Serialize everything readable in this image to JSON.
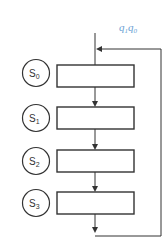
{
  "diagram": {
    "title_label": {
      "main1": "q",
      "sub1": "1",
      "main2": "q",
      "sub2": "0",
      "color": "#6a9fd4"
    },
    "states": [
      {
        "letter": "S",
        "index": "0"
      },
      {
        "letter": "S",
        "index": "1"
      },
      {
        "letter": "S",
        "index": "2"
      },
      {
        "letter": "S",
        "index": "3"
      }
    ],
    "stages": [
      {
        "label": ""
      },
      {
        "label": ""
      },
      {
        "label": ""
      },
      {
        "label": ""
      }
    ],
    "line_color": "#333333"
  }
}
